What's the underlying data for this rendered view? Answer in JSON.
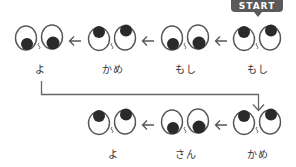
{
  "badge": {
    "label": "START",
    "color": "#5a5a5a"
  },
  "rows": [
    {
      "pairs": [
        {
          "label": "よ",
          "gaze": "down"
        },
        {
          "label": "かめ",
          "gaze": "up"
        },
        {
          "label": "もし",
          "gaze": "down"
        },
        {
          "label": "もし",
          "gaze": "up"
        }
      ]
    },
    {
      "pairs": [
        {
          "label": "よ",
          "gaze": "up"
        },
        {
          "label": "さん",
          "gaze": "down"
        },
        {
          "label": "かめ",
          "gaze": "up"
        }
      ]
    }
  ],
  "icons": {
    "arrow": "arrow-left-icon",
    "connector": "return-arrow-down-icon",
    "eyes": "googly-eyes-icon"
  },
  "colors": {
    "stroke": "#555555",
    "pupil": "#2a2a2a",
    "text": "#333333"
  }
}
